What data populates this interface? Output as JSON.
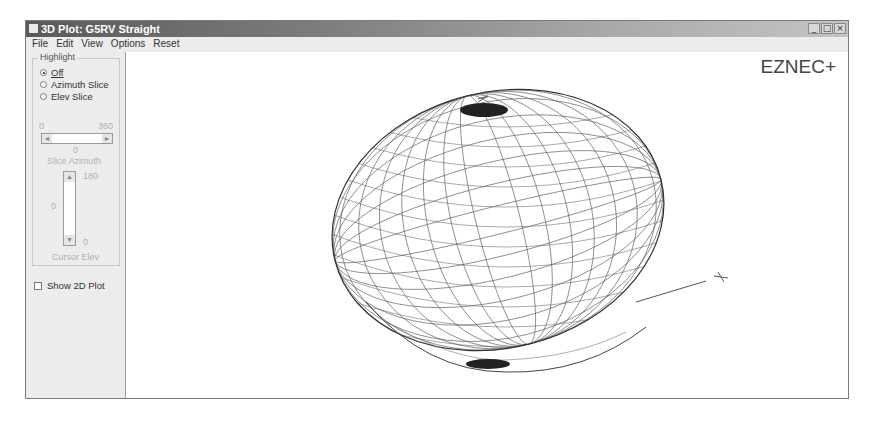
{
  "window": {
    "title": "3D Plot: G5RV Straight",
    "controls": {
      "minimize": "_",
      "maximize": "□",
      "close": "×"
    }
  },
  "menu": [
    "File",
    "Edit",
    "View",
    "Options",
    "Reset"
  ],
  "highlight": {
    "group_label": "Highlight",
    "options": [
      {
        "label": "Off",
        "selected": true
      },
      {
        "label": "Azimuth Slice",
        "selected": false
      },
      {
        "label": "Elev Slice",
        "selected": false
      }
    ],
    "azimuth": {
      "min": "0",
      "max": "360",
      "value": "0",
      "label": "Slice Azimuth"
    },
    "elevation": {
      "max": "180",
      "min": "0",
      "value": "0",
      "label": "Cursor Elev"
    }
  },
  "show_2d_plot": {
    "label": "Show 2D Plot",
    "checked": false
  },
  "plot": {
    "brand": "EZNEC+",
    "axis_labels": {
      "x": "X",
      "z": "Z"
    }
  },
  "icons": {
    "app": "app-window-icon",
    "scroll_left": "◄",
    "scroll_right": "►",
    "scroll_up": "▲",
    "scroll_down": "▼"
  }
}
